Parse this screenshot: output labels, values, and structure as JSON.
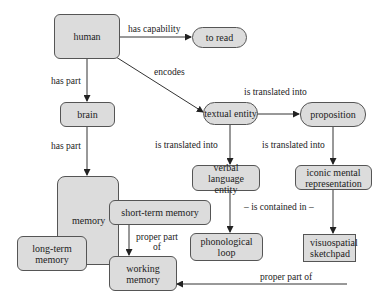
{
  "diagram": {
    "nodes": {
      "human": {
        "label": "human",
        "shape": "rounded"
      },
      "to_read": {
        "label": "to read",
        "shape": "pill"
      },
      "brain": {
        "label": "brain",
        "shape": "rounded"
      },
      "textual_entity": {
        "label": "textual entity",
        "shape": "pill"
      },
      "proposition": {
        "label": "proposition",
        "shape": "pill"
      },
      "verbal_language_entity": {
        "label": "verbal language entity",
        "shape": "rounded"
      },
      "iconic_mental_representation": {
        "label": "iconic mental representation",
        "shape": "rounded"
      },
      "memory": {
        "label": "memory",
        "shape": "rounded"
      },
      "short_term_memory": {
        "label": "short-term memory",
        "shape": "rounded"
      },
      "long_term_memory": {
        "label": "long-term memory",
        "shape": "rounded"
      },
      "working_memory": {
        "label": "working memory",
        "shape": "rounded"
      },
      "phonological_loop": {
        "label": "phonological loop",
        "shape": "rounded"
      },
      "visuospatial_sketchpad": {
        "label": "visuospatial sketchpad",
        "shape": "square"
      }
    },
    "edges": [
      {
        "from": "human",
        "to": "to_read",
        "label": "has capability"
      },
      {
        "from": "human",
        "to": "brain",
        "label": "has part"
      },
      {
        "from": "human",
        "to": "textual_entity",
        "label": "encodes"
      },
      {
        "from": "brain",
        "to": "memory",
        "label": "has part"
      },
      {
        "from": "textual_entity",
        "to": "proposition",
        "label": "is translated into"
      },
      {
        "from": "textual_entity",
        "to": "verbal_language_entity",
        "label": "is translated into"
      },
      {
        "from": "proposition",
        "to": "iconic_mental_representation",
        "label": "is translated into"
      },
      {
        "from": "verbal_language_entity",
        "to": "phonological_loop",
        "label": ""
      },
      {
        "from": "iconic_mental_representation",
        "to": "visuospatial_sketchpad",
        "label": ""
      },
      {
        "from": "short_term_memory",
        "to": "working_memory",
        "label": "proper part of"
      },
      {
        "from": "visuospatial_sketchpad",
        "to": "working_memory",
        "label": "proper part of"
      }
    ],
    "annotations": {
      "contained_in": "– is contained in –"
    },
    "labels": {
      "has_capability": "has capability",
      "has_part_1": "has part",
      "encodes": "encodes",
      "has_part_2": "has part",
      "is_translated_into_1": "is translated into",
      "is_translated_into_2": "is translated into",
      "is_translated_into_3": "is translated into",
      "proper_part_of_1_line1": "proper part",
      "proper_part_of_1_line2": "of",
      "proper_part_of_2": "proper part of"
    },
    "colors": {
      "node_fill": "#dcdcdc",
      "node_border": "#555555",
      "edge": "#333333",
      "background": "#ffffff"
    }
  }
}
